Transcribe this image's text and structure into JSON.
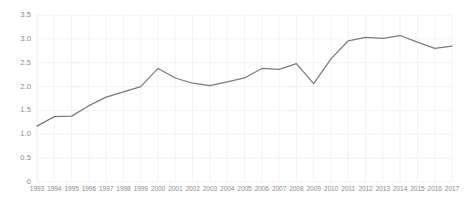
{
  "chart_data": {
    "type": "line",
    "title": "",
    "subtitle": "",
    "xlabel": "",
    "ylabel": "",
    "categories": [
      "1993",
      "1994",
      "1995",
      "1996",
      "1997",
      "1998",
      "1999",
      "2000",
      "2001",
      "2002",
      "2003",
      "2004",
      "2005",
      "2006",
      "2007",
      "2008",
      "2009",
      "2010",
      "2011",
      "2012",
      "2013",
      "2014",
      "2015",
      "2016",
      "2017"
    ],
    "values": [
      1.17,
      1.37,
      1.38,
      1.6,
      1.78,
      1.89,
      2.0,
      2.38,
      2.18,
      2.07,
      2.02,
      2.1,
      2.18,
      2.38,
      2.36,
      2.48,
      2.06,
      2.58,
      2.96,
      3.03,
      3.01,
      3.07,
      2.93,
      2.8,
      2.85
    ],
    "series": [
      {
        "name": "series-1",
        "color": "#7b7b7b",
        "values": [
          1.17,
          1.37,
          1.38,
          1.6,
          1.78,
          1.89,
          2.0,
          2.38,
          2.18,
          2.07,
          2.02,
          2.1,
          2.18,
          2.38,
          2.36,
          2.48,
          2.06,
          2.58,
          2.96,
          3.03,
          3.01,
          3.07,
          2.93,
          2.8,
          2.85
        ]
      }
    ],
    "ylim": [
      0,
      3.5
    ],
    "y_ticks": [
      0,
      0.5,
      1.0,
      1.5,
      2.0,
      2.5,
      3.0,
      3.5
    ],
    "y_tick_labels": [
      "0",
      "0.5",
      "1.0",
      "1.5",
      "2.0",
      "2.5",
      "3.0",
      "3.5"
    ],
    "grid": {
      "horizontal": true,
      "vertical": true,
      "color": "#f2f2f2"
    },
    "legend": {
      "visible": false,
      "position": "none",
      "entries": []
    },
    "annotations": []
  },
  "colors": {
    "background": "#ffffff",
    "line": "#7b7b7b",
    "grid": "#f2f2f2",
    "tick_text": "#8c8c8c"
  }
}
